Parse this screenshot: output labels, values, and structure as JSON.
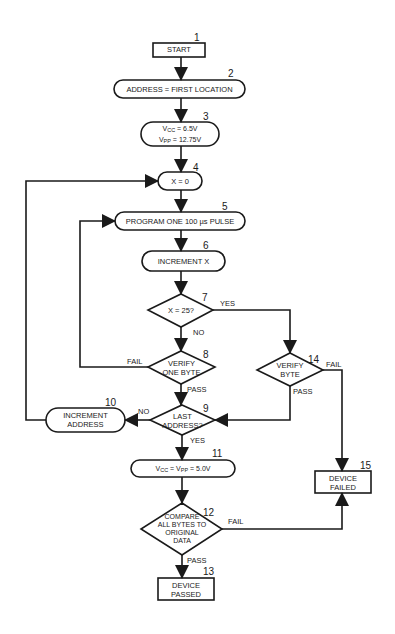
{
  "diagram": {
    "type": "flowchart",
    "stroke_color": "#1a1a1a",
    "background": "#ffffff",
    "nodes": [
      {
        "id": 1,
        "number": "1",
        "shape": "rect",
        "label": "START"
      },
      {
        "id": 2,
        "number": "2",
        "shape": "rounded",
        "label": "ADDRESS = FIRST LOCATION"
      },
      {
        "id": 3,
        "number": "3",
        "shape": "rounded",
        "line1_prefix": "V",
        "line1_sub": "CC",
        "line1_suffix": " = 6.5V",
        "line2_prefix": "V",
        "line2_sub": "PP",
        "line2_suffix": " = 12.75V"
      },
      {
        "id": 4,
        "number": "4",
        "shape": "rounded",
        "label": "X = 0"
      },
      {
        "id": 5,
        "number": "5",
        "shape": "rounded",
        "label": "PROGRAM ONE 100 µs PULSE"
      },
      {
        "id": 6,
        "number": "6",
        "shape": "rounded",
        "label": "INCREMENT X"
      },
      {
        "id": 7,
        "number": "7",
        "shape": "diamond",
        "label": "X = 25?"
      },
      {
        "id": 8,
        "number": "8",
        "shape": "diamond",
        "line1": "VERIFY",
        "line2": "ONE BYTE"
      },
      {
        "id": 9,
        "number": "9",
        "shape": "diamond",
        "line1": "LAST",
        "line2": "ADDRESS?"
      },
      {
        "id": 10,
        "number": "10",
        "shape": "rounded",
        "line1": "INCREMENT",
        "line2": "ADDRESS"
      },
      {
        "id": 11,
        "number": "11",
        "shape": "rounded",
        "p1": "V",
        "s1": "CC",
        "m": " = V",
        "s2": "PP",
        "end": " = 5.0V"
      },
      {
        "id": 12,
        "number": "12",
        "shape": "diamond",
        "line1": "COMPARE",
        "line2": "ALL BYTES TO",
        "line3": "ORIGINAL",
        "line4": "DATA"
      },
      {
        "id": 13,
        "number": "13",
        "shape": "rect",
        "line1": "DEVICE",
        "line2": "PASSED"
      },
      {
        "id": 14,
        "number": "14",
        "shape": "diamond",
        "line1": "VERIFY",
        "line2": "BYTE"
      },
      {
        "id": 15,
        "number": "15",
        "shape": "rect",
        "line1": "DEVICE",
        "line2": "FAILED"
      }
    ],
    "edge_labels": {
      "x25_yes": "YES",
      "x25_no": "NO",
      "verify_one_fail": "FAIL",
      "verify_one_pass": "PASS",
      "last_no": "NO",
      "last_yes": "YES",
      "verify_byte_fail": "FAIL",
      "verify_byte_pass": "PASS",
      "compare_fail": "FAIL",
      "compare_pass": "PASS"
    },
    "edges": [
      {
        "from": 1,
        "to": 2
      },
      {
        "from": 2,
        "to": 3
      },
      {
        "from": 3,
        "to": 4
      },
      {
        "from": 4,
        "to": 5
      },
      {
        "from": 5,
        "to": 6
      },
      {
        "from": 6,
        "to": 7
      },
      {
        "from": 7,
        "to": 8,
        "label": "NO"
      },
      {
        "from": 7,
        "to": 14,
        "label": "YES"
      },
      {
        "from": 8,
        "to": 5,
        "label": "FAIL"
      },
      {
        "from": 8,
        "to": 9,
        "label": "PASS"
      },
      {
        "from": 14,
        "to": 9,
        "label": "PASS"
      },
      {
        "from": 14,
        "to": 15,
        "label": "FAIL"
      },
      {
        "from": 9,
        "to": 10,
        "label": "NO"
      },
      {
        "from": 10,
        "to": 4
      },
      {
        "from": 9,
        "to": 11,
        "label": "YES"
      },
      {
        "from": 11,
        "to": 12
      },
      {
        "from": 12,
        "to": 13,
        "label": "PASS"
      },
      {
        "from": 12,
        "to": 15,
        "label": "FAIL"
      }
    ]
  }
}
